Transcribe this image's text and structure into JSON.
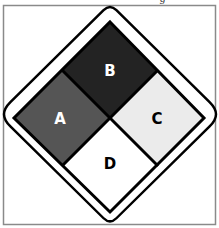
{
  "figure": {
    "cropped_top_text_fragment": "g",
    "frame_color": "#8a8a8a",
    "outline_color": "#000000"
  },
  "quadrants": [
    {
      "position": "top",
      "label": "B",
      "fill": "#232323",
      "label_color": "#ffffff"
    },
    {
      "position": "left",
      "label": "A",
      "fill": "#555555",
      "label_color": "#ffffff"
    },
    {
      "position": "right",
      "label": "C",
      "fill": "#ebebeb",
      "label_color": "#000000"
    },
    {
      "position": "bottom",
      "label": "D",
      "fill": "#ffffff",
      "label_color": "#000000"
    }
  ]
}
